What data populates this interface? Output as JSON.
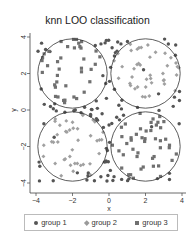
{
  "chart_data": {
    "type": "scatter",
    "title": "knn LOO classification",
    "xlabel": "x",
    "ylabel": "y",
    "xlim": [
      -4,
      4
    ],
    "ylim": [
      -4,
      4
    ],
    "xticks": [
      "-4",
      "-2",
      "0",
      "2",
      "4"
    ],
    "yticks": [
      "-4",
      "-2",
      "0",
      "2",
      "4"
    ],
    "grid": false,
    "legend_position": "bottom",
    "legend": [
      {
        "label": "group 1",
        "marker": "circle",
        "color": "#555555"
      },
      {
        "label": "group 2",
        "marker": "diamond",
        "color": "#9a9a9a"
      },
      {
        "label": "group 3",
        "marker": "square",
        "color": "#707070"
      }
    ],
    "circles": [
      {
        "cx": -2,
        "cy": 2,
        "r": 1.9
      },
      {
        "cx": 2,
        "cy": 2,
        "r": 1.9
      },
      {
        "cx": -2,
        "cy": -2,
        "r": 1.9
      },
      {
        "cx": 2,
        "cy": -2,
        "r": 1.9
      }
    ],
    "series": [
      {
        "name": "group 1",
        "description": "points outside all circles (background region), roughly uniform over [-4,4]x[-4,4]",
        "approx_count": 300
      },
      {
        "name": "group 2",
        "description": "points mostly inside top-right and bottom-left circles",
        "approx_count": 90
      },
      {
        "name": "group 3",
        "description": "points mostly inside top-left and bottom-right circles",
        "approx_count": 110
      }
    ],
    "cluster_assignment": {
      "top_left": "group 3",
      "top_right": "group 2",
      "bottom_left": "group 2",
      "bottom_right": "group 3"
    }
  },
  "plot_area": {
    "x0": 30,
    "y0": 33,
    "x1": 186,
    "y1": 193
  },
  "axis_map": {
    "x_at_minus4": 36,
    "x_at_4": 182,
    "y_at_4": 37,
    "y_at_minus4": 183
  }
}
